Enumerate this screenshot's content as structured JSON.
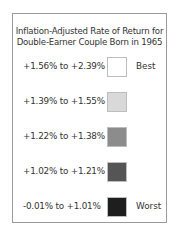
{
  "legend": {
    "title_line1": "Inflation-Adjusted Rate of Return for",
    "title_line2": "Double-Earner Couple Born in 1965",
    "rows": [
      {
        "label": "+1.56% to +2.39%",
        "color": "#ffffff",
        "tag": "Best"
      },
      {
        "label": "+1.39% to +1.55%",
        "color": "#d9d9d9",
        "tag": ""
      },
      {
        "label": "+1.22% to +1.38%",
        "color": "#8c8c8c",
        "tag": ""
      },
      {
        "label": "+1.02% to +1.21%",
        "color": "#555555",
        "tag": ""
      },
      {
        "label": "-0.01% to +1.01%",
        "color": "#1e1e1e",
        "tag": "Worst"
      }
    ]
  }
}
